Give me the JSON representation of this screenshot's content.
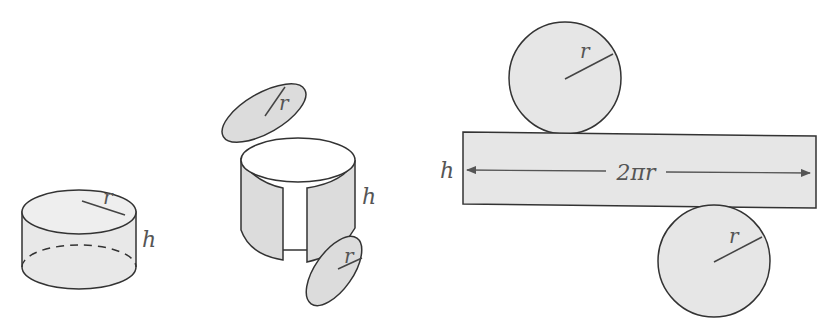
{
  "diagram": {
    "colors": {
      "fill": "#e6e6e6",
      "stroke": "#333333",
      "label": "#555555",
      "lid": "#ffffff"
    },
    "cylinder": {
      "radius_label": "r",
      "height_label": "h"
    },
    "unfolding": {
      "top_radius_label": "r",
      "bottom_radius_label": "r",
      "height_label": "h"
    },
    "net": {
      "top_circle_label": "r",
      "bottom_circle_label": "r",
      "height_label": "h",
      "width_label": "2πr"
    }
  }
}
